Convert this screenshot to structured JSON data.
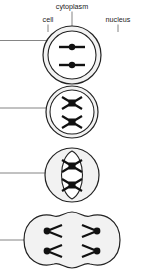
{
  "diagram": {
    "labels": {
      "cytoplasm": "cytoplasm",
      "cell": "cell",
      "nucleus": "nucleus"
    },
    "colors": {
      "outline": "#222222",
      "chromosome": "#111111",
      "cell_fill": "#f2f2f2",
      "nucleus_fill": "#ffffff",
      "leader": "#777777",
      "background": "#ffffff"
    },
    "stages": [
      {
        "name": "interphase",
        "chromosome_shape": "rod",
        "chromosome_count": 2,
        "has_nucleus": true,
        "cell_shape": "circle"
      },
      {
        "name": "prophase",
        "chromosome_shape": "x",
        "chromosome_count": 2,
        "has_nucleus": true,
        "cell_shape": "circle"
      },
      {
        "name": "metaphase",
        "chromosome_shape": "x",
        "chromosome_count": 2,
        "has_nucleus": true,
        "cell_shape": "circle"
      },
      {
        "name": "anaphase",
        "chromosome_shape": "v",
        "chromosome_count": 4,
        "has_nucleus": false,
        "cell_shape": "dumbbell"
      }
    ]
  }
}
